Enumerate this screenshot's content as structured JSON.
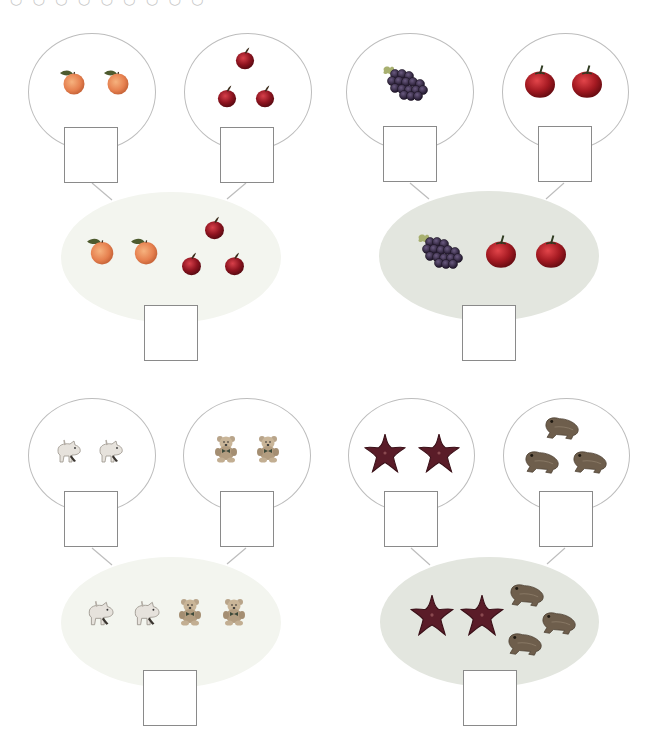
{
  "header": {
    "text": "○ ○ ○ ○ ○ ○ ○ ○ ○"
  },
  "colors": {
    "outline": "#bdbdbd",
    "box_border": "#8a8a8a",
    "oval_light": "#f3f5ef",
    "oval_dark": "#e3e6df",
    "peach": "#e98a5a",
    "apple_red": "#9a1622",
    "grape": "#3b2a4a",
    "tomato": "#a81b22",
    "starfish": "#6b1f2a",
    "frog": "#6a5a4a"
  },
  "problems": [
    {
      "id": "peaches-apples",
      "left_set": {
        "item": "peach-icon",
        "count": 2
      },
      "right_set": {
        "item": "apple-icon",
        "count": 3
      },
      "combined": {
        "items": [
          "peach-icon",
          "peach-icon",
          "apple-icon",
          "apple-icon",
          "apple-icon"
        ],
        "total_count": 5
      },
      "answers": {
        "left": "",
        "right": "",
        "total": ""
      }
    },
    {
      "id": "grapes-tomatoes",
      "left_set": {
        "item": "grape-bunch-icon",
        "count": 1
      },
      "right_set": {
        "item": "tomato-icon",
        "count": 2
      },
      "combined": {
        "items": [
          "grape-bunch-icon",
          "tomato-icon",
          "tomato-icon"
        ],
        "total_count": 3
      },
      "answers": {
        "left": "",
        "right": "",
        "total": ""
      }
    },
    {
      "id": "pigs-bears",
      "left_set": {
        "item": "toy-pig-icon",
        "count": 2
      },
      "right_set": {
        "item": "teddy-bear-icon",
        "count": 2
      },
      "combined": {
        "items": [
          "toy-pig-icon",
          "toy-pig-icon",
          "teddy-bear-icon",
          "teddy-bear-icon"
        ],
        "total_count": 4
      },
      "answers": {
        "left": "",
        "right": "",
        "total": ""
      }
    },
    {
      "id": "starfish-frogs",
      "left_set": {
        "item": "starfish-icon",
        "count": 2
      },
      "right_set": {
        "item": "frog-icon",
        "count": 3
      },
      "combined": {
        "items": [
          "starfish-icon",
          "starfish-icon",
          "frog-icon",
          "frog-icon",
          "frog-icon"
        ],
        "total_count": 5
      },
      "answers": {
        "left": "",
        "right": "",
        "total": ""
      }
    }
  ]
}
